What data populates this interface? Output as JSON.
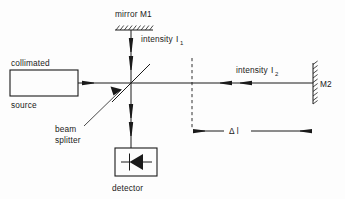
{
  "diagram": {
    "type": "optical-schematic",
    "background_color": "#fdfdfd",
    "line_color": "#1a1a1a"
  },
  "labels": {
    "mirror_m1": "mirror M1",
    "intensity_1_text": "intensity",
    "intensity_1_symbol": "I",
    "intensity_1_subscript": "1",
    "intensity_2_text": "intensity",
    "intensity_2_symbol": "I",
    "intensity_2_subscript": "2",
    "source_top": "collimated",
    "source_bottom": "source",
    "beam_splitter_line1": "beam",
    "beam_splitter_line2": "splitter",
    "detector": "detector",
    "mirror_m2": "M2",
    "path_difference": "Δ l"
  },
  "components": [
    {
      "name": "collimated-source",
      "kind": "box",
      "label_above": "collimated",
      "label_below": "source",
      "x": 10,
      "y": 70,
      "width": 68,
      "height": 26
    },
    {
      "name": "mirror-m1",
      "kind": "hatched-mirror",
      "orientation": "horizontal",
      "label": "mirror M1",
      "x": 115,
      "y": 25,
      "length": 38
    },
    {
      "name": "mirror-m2",
      "kind": "hatched-mirror",
      "orientation": "vertical",
      "label": "M2",
      "x": 313,
      "y": 65,
      "length": 40
    },
    {
      "name": "beam-splitter",
      "kind": "diagonal-line",
      "label": "beam splitter",
      "x1": 112,
      "y1": 102,
      "x2": 150,
      "y2": 64
    },
    {
      "name": "detector",
      "kind": "photodiode-box",
      "label": "detector",
      "x": 115,
      "y": 148,
      "width": 42,
      "height": 28
    },
    {
      "name": "reference-plane",
      "kind": "dashed-vertical-line",
      "x": 192,
      "y1": 58,
      "y2": 128
    },
    {
      "name": "path-difference-dimension",
      "kind": "dimension-line",
      "label": "Δ l",
      "x1": 192,
      "x2": 312,
      "y": 131
    }
  ],
  "beams": [
    {
      "name": "source-beam",
      "direction": "right",
      "from": "collimated-source",
      "to": "beam-splitter"
    },
    {
      "name": "m1-arm-beam",
      "direction": "down",
      "from": "mirror-m1",
      "to": "beam-splitter",
      "intensity_label": "I1"
    },
    {
      "name": "m2-arm-beam",
      "direction": "left",
      "from": "mirror-m2",
      "to": "beam-splitter",
      "intensity_label": "I2"
    },
    {
      "name": "detector-beam",
      "direction": "down",
      "from": "beam-splitter",
      "to": "detector"
    }
  ]
}
